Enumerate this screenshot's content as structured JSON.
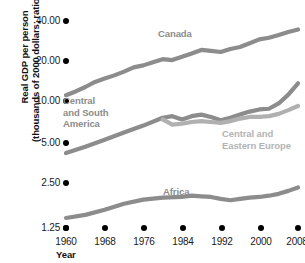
{
  "chart_data": {
    "type": "line",
    "title": "",
    "xlabel": "Year",
    "ylabel": "Real GDP per person (thousands of 2000 dollars; ratio scale)",
    "ylabel_line1": "Real GDP per person",
    "ylabel_line2": "(thousands of 2000 dollars; ratio scale)",
    "scale": "log2 ratio scale",
    "grid": false,
    "legend": "inline series labels",
    "xlim": [
      1960,
      2008
    ],
    "ylim": [
      1.25,
      40.0
    ],
    "xticks": [
      "1960",
      "1968",
      "1976",
      "1984",
      "1992",
      "2000",
      "2008"
    ],
    "xtick_values": [
      1960,
      1968,
      1976,
      1984,
      1992,
      2000,
      2008
    ],
    "yticks": [
      "40.00",
      "20.00",
      "10.00",
      "5.00",
      "2.50",
      "1.25"
    ],
    "ytick_values": [
      40.0,
      20.0,
      10.0,
      5.0,
      2.5,
      1.25
    ],
    "series": [
      {
        "name": "Canada",
        "color": "#8c8c8c",
        "x": [
          1960,
          1962,
          1964,
          1966,
          1968,
          1970,
          1972,
          1974,
          1976,
          1978,
          1980,
          1982,
          1984,
          1986,
          1988,
          1990,
          1992,
          1994,
          1996,
          1998,
          2000,
          2002,
          2004,
          2006,
          2008
        ],
        "values": [
          10.5,
          11.2,
          12.1,
          13.2,
          14.0,
          14.8,
          15.8,
          17.0,
          17.6,
          18.6,
          19.6,
          19.3,
          20.4,
          21.6,
          23.0,
          22.6,
          22.2,
          23.4,
          24.2,
          25.8,
          27.6,
          28.4,
          29.8,
          31.4,
          32.8
        ]
      },
      {
        "name": "Central and South America",
        "color": "#8c8c8c",
        "x": [
          1960,
          1964,
          1968,
          1972,
          1976,
          1980,
          1982,
          1984,
          1986,
          1988,
          1990,
          1992,
          1994,
          1996,
          1998,
          2000,
          2002,
          2004,
          2006,
          2008
        ],
        "values": [
          3.85,
          4.3,
          4.85,
          5.5,
          6.2,
          7.1,
          7.3,
          6.9,
          7.3,
          7.5,
          7.2,
          6.8,
          7.1,
          7.5,
          7.9,
          8.2,
          8.3,
          9.1,
          10.6,
          12.9
        ]
      },
      {
        "name": "Central and Eastern Europe",
        "color": "#b0b0b0",
        "x": [
          1980,
          1982,
          1984,
          1986,
          1988,
          1990,
          1992,
          1994,
          1996,
          1998,
          2000,
          2002,
          2004,
          2006,
          2008
        ],
        "values": [
          6.9,
          6.3,
          6.4,
          6.6,
          6.7,
          6.6,
          6.5,
          6.7,
          7.0,
          7.2,
          7.2,
          7.3,
          7.6,
          8.1,
          8.7
        ]
      },
      {
        "name": "Africa",
        "color": "#8c8c8c",
        "x": [
          1960,
          1964,
          1968,
          1972,
          1976,
          1980,
          1984,
          1986,
          1988,
          1990,
          1992,
          1994,
          1996,
          1998,
          2000,
          2002,
          2004,
          2006,
          2008
        ],
        "values": [
          1.25,
          1.32,
          1.44,
          1.6,
          1.72,
          1.78,
          1.8,
          1.84,
          1.82,
          1.8,
          1.74,
          1.7,
          1.74,
          1.78,
          1.8,
          1.84,
          1.9,
          2.0,
          2.12
        ]
      }
    ],
    "series_label_positions": [
      {
        "name": "Canada",
        "lines": [
          "Canada"
        ],
        "x": 158,
        "y": 28,
        "color": "#8c8c8c"
      },
      {
        "name": "Central and South America",
        "lines": [
          "Central",
          "and South",
          "America"
        ],
        "x": 63,
        "y": 95,
        "color": "#8c8c8c"
      },
      {
        "name": "Central and Eastern Europe",
        "lines": [
          "Central and",
          "Eastern Europe"
        ],
        "x": 222,
        "y": 128,
        "color": "#b3b3b3"
      },
      {
        "name": "Africa",
        "lines": [
          "Africa"
        ],
        "x": 163,
        "y": 186,
        "color": "#8c8c8c"
      }
    ]
  },
  "colors": {
    "background": "#ffffff",
    "tick_dot": "#000000",
    "axis_text": "#1a1a1a",
    "title_text": "#111111",
    "series_dark": "#8c8c8c",
    "series_light": "#b0b0b0"
  }
}
